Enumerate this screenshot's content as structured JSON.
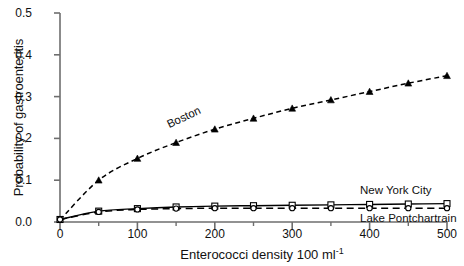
{
  "chart_data": {
    "type": "line",
    "title": "",
    "xlabel": "Enterococci density 100 ml",
    "xlabel_exponent": "-1",
    "ylabel": "Probability of gastroenteritis",
    "xlim": [
      0,
      500
    ],
    "ylim": [
      0.0,
      0.5
    ],
    "xticks": [
      0,
      100,
      200,
      300,
      400,
      500
    ],
    "xtick_labels": [
      "0",
      "100",
      "200",
      "300",
      "400",
      "500"
    ],
    "xminor_ticks": [
      50,
      150,
      250,
      350,
      450
    ],
    "yticks": [
      0.0,
      0.1,
      0.2,
      0.3,
      0.4,
      0.5
    ],
    "ytick_labels": [
      "0.0",
      "0.1",
      "0.2",
      "0.3",
      "0.4",
      "0.5"
    ],
    "grid": false,
    "legend_position": "inline-annotations",
    "x": [
      0,
      50,
      100,
      150,
      200,
      250,
      300,
      350,
      400,
      450,
      500
    ],
    "series": [
      {
        "name": "Boston",
        "style": "dashed",
        "marker": "triangle",
        "color": "#000000",
        "values": [
          0.005,
          0.1,
          0.152,
          0.19,
          0.222,
          0.248,
          0.272,
          0.292,
          0.312,
          0.332,
          0.35
        ]
      },
      {
        "name": "New York City",
        "style": "solid",
        "marker": "open-square",
        "color": "#000000",
        "values": [
          0.006,
          0.026,
          0.032,
          0.036,
          0.038,
          0.039,
          0.04,
          0.041,
          0.042,
          0.043,
          0.044
        ]
      },
      {
        "name": "Lake Pontchartrain",
        "style": "dashed",
        "marker": "open-circle",
        "color": "#000000",
        "values": [
          0.006,
          0.024,
          0.03,
          0.032,
          0.033,
          0.033,
          0.033,
          0.033,
          0.033,
          0.033,
          0.033
        ]
      }
    ],
    "annotations": [
      {
        "text": "Boston",
        "x": 130,
        "y": 0.21,
        "rotation": -25
      },
      {
        "text": "New York City",
        "x": 375,
        "y": 0.095,
        "rotation": 0
      },
      {
        "text": "Lake Pontchartrain",
        "x": 375,
        "y": 0.018,
        "rotation": 0
      }
    ]
  }
}
